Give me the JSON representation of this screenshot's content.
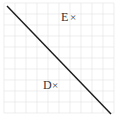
{
  "diagram": {
    "type": "grid-with-line",
    "grid": {
      "cols": 10,
      "rows": 10,
      "color": "#e2e2e2"
    },
    "line": {
      "from": [
        7,
        6
      ],
      "to": [
        111,
        114
      ],
      "color": "#1a1a1a"
    },
    "points": [
      {
        "label": "E",
        "marker": "×",
        "x": 61,
        "y": 21
      },
      {
        "label": "D",
        "marker": "×",
        "x": 43,
        "y": 89
      }
    ]
  }
}
